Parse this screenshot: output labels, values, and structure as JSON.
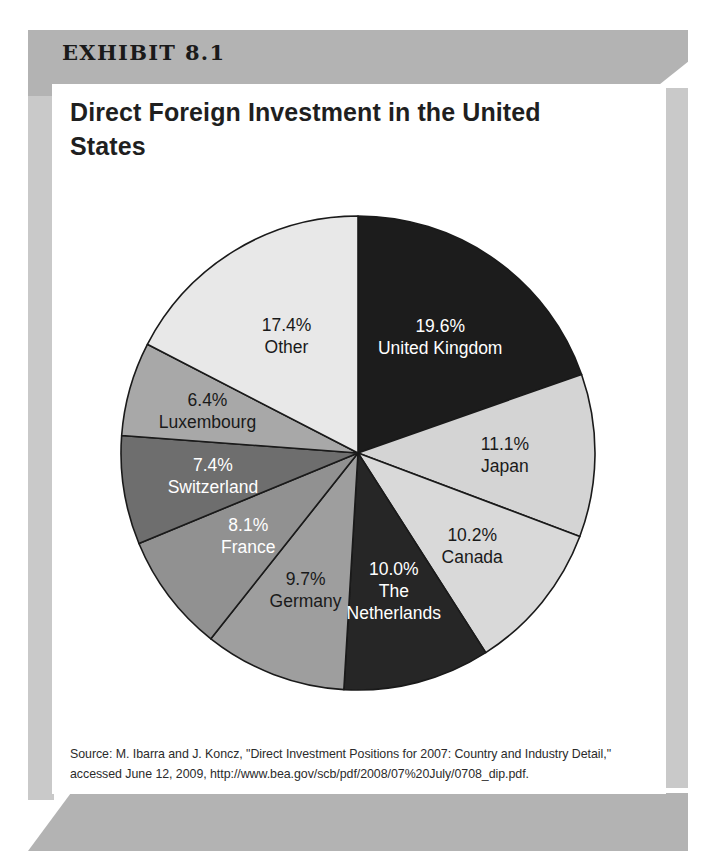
{
  "exhibit": {
    "label": "EXHIBIT 8.1",
    "title": "Direct Foreign Investment in the United States",
    "source": "Source: M. Ibarra and J. Koncz, \"Direct Investment Positions for 2007: Country and Industry Detail,\" accessed June 12, 2009, http://www.bea.gov/scb/pdf/2008/07%20July/0708_dip.pdf."
  },
  "colors": {
    "band": "#b3b3b3",
    "edge_strip": "#c9c9c9",
    "panel": "#ffffff",
    "slice_outline": "#1a1a1a"
  },
  "chart_data": {
    "type": "pie",
    "title": "Direct Foreign Investment in the United States",
    "unit": "percent",
    "start_angle_deg": 0,
    "direction": "clockwise",
    "legend": "none-labels-inside",
    "categories": [
      "United Kingdom",
      "Japan",
      "Canada",
      "The Netherlands",
      "Germany",
      "France",
      "Switzerland",
      "Luxembourg",
      "Other"
    ],
    "values": [
      19.6,
      11.1,
      10.2,
      10.0,
      9.7,
      8.1,
      7.4,
      6.4,
      17.4
    ],
    "slices": [
      {
        "label": "United Kingdom",
        "value": 19.6,
        "percent_text": "19.6%",
        "fill": "#1c1c1c",
        "text_color": "#ffffff",
        "label_lines": [
          "19.6%",
          "United Kingdom"
        ]
      },
      {
        "label": "Japan",
        "value": 11.1,
        "percent_text": "11.1%",
        "fill": "#d4d4d4",
        "text_color": "#1a1a1a",
        "label_lines": [
          "11.1%",
          "Japan"
        ]
      },
      {
        "label": "Canada",
        "value": 10.2,
        "percent_text": "10.2%",
        "fill": "#d9d9d9",
        "text_color": "#1a1a1a",
        "label_lines": [
          "10.2%",
          "Canada"
        ]
      },
      {
        "label": "The Netherlands",
        "value": 10.0,
        "percent_text": "10.0%",
        "fill": "#262626",
        "text_color": "#ffffff",
        "label_lines": [
          "10.0%",
          "The",
          "Netherlands"
        ]
      },
      {
        "label": "Germany",
        "value": 9.7,
        "percent_text": "9.7%",
        "fill": "#9e9e9e",
        "text_color": "#1a1a1a",
        "label_lines": [
          "9.7%",
          "Germany"
        ]
      },
      {
        "label": "France",
        "value": 8.1,
        "percent_text": "8.1%",
        "fill": "#919191",
        "text_color": "#ffffff",
        "label_lines": [
          "8.1%",
          "France"
        ]
      },
      {
        "label": "Switzerland",
        "value": 7.4,
        "percent_text": "7.4%",
        "fill": "#6e6e6e",
        "text_color": "#ffffff",
        "label_lines": [
          "7.4%",
          "Switzerland"
        ]
      },
      {
        "label": "Luxembourg",
        "value": 6.4,
        "percent_text": "6.4%",
        "fill": "#a8a8a8",
        "text_color": "#1a1a1a",
        "label_lines": [
          "6.4%",
          "Luxembourg"
        ]
      },
      {
        "label": "Other",
        "value": 17.4,
        "percent_text": "17.4%",
        "fill": "#e8e8e8",
        "text_color": "#1a1a1a",
        "label_lines": [
          "17.4%",
          "Other"
        ]
      }
    ]
  }
}
